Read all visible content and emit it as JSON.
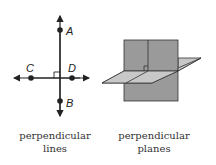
{
  "figures": [
    {
      "id": "perpendicular-lines",
      "caption_line1": "perpendicular",
      "caption_line2": "lines",
      "points": [
        {
          "label": "A"
        },
        {
          "label": "B"
        },
        {
          "label": "C"
        },
        {
          "label": "D"
        }
      ]
    },
    {
      "id": "perpendicular-planes",
      "caption_line1": "perpendicular",
      "caption_line2": "planes"
    }
  ],
  "colors": {
    "line": "#222222",
    "vertical_plane": "#9a9a9a",
    "horizontal_plane": "#c8c8c8",
    "plane_edge": "#333333"
  }
}
